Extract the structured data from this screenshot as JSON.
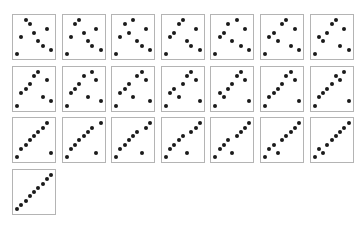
{
  "figure": {
    "columns": 7,
    "panel_width": 44,
    "panel_height": 46,
    "pitch_x": 49.6,
    "pitch_y": 51.7,
    "border_color": "#b4b4b4",
    "dot_color": "#1a1a1a"
  },
  "chart_data": {
    "type": "scatter",
    "title": "",
    "xlabel": "",
    "ylabel": "",
    "n": 9,
    "xlim": [
      0,
      8
    ],
    "ylim": [
      0,
      8
    ],
    "grid": false,
    "steps": [
      [
        0,
        4,
        8,
        7,
        5,
        3,
        2,
        6,
        1
      ],
      [
        0,
        4,
        7,
        8,
        5,
        3,
        2,
        6,
        1
      ],
      [
        0,
        4,
        7,
        5,
        8,
        3,
        2,
        6,
        1
      ],
      [
        0,
        4,
        5,
        7,
        8,
        3,
        2,
        6,
        1
      ],
      [
        0,
        4,
        5,
        7,
        3,
        8,
        2,
        6,
        1
      ],
      [
        0,
        4,
        5,
        3,
        7,
        8,
        2,
        6,
        1
      ],
      [
        0,
        4,
        3,
        5,
        7,
        8,
        2,
        6,
        1
      ],
      [
        0,
        3,
        4,
        5,
        7,
        8,
        2,
        6,
        1
      ],
      [
        0,
        3,
        4,
        5,
        7,
        2,
        8,
        6,
        1
      ],
      [
        0,
        3,
        4,
        5,
        2,
        7,
        8,
        6,
        1
      ],
      [
        0,
        3,
        4,
        2,
        5,
        7,
        8,
        6,
        1
      ],
      [
        0,
        3,
        2,
        4,
        5,
        7,
        8,
        6,
        1
      ],
      [
        0,
        2,
        3,
        4,
        5,
        7,
        8,
        6,
        1
      ],
      [
        0,
        2,
        3,
        4,
        5,
        7,
        6,
        8,
        1
      ],
      [
        0,
        2,
        3,
        4,
        5,
        6,
        7,
        8,
        1
      ],
      [
        0,
        2,
        3,
        4,
        5,
        6,
        7,
        1,
        8
      ],
      [
        0,
        2,
        3,
        4,
        5,
        6,
        1,
        7,
        8
      ],
      [
        0,
        2,
        3,
        4,
        5,
        1,
        6,
        7,
        8
      ],
      [
        0,
        2,
        3,
        4,
        1,
        5,
        6,
        7,
        8
      ],
      [
        0,
        2,
        3,
        1,
        4,
        5,
        6,
        7,
        8
      ],
      [
        0,
        2,
        1,
        3,
        4,
        5,
        6,
        7,
        8
      ],
      [
        0,
        1,
        2,
        3,
        4,
        5,
        6,
        7,
        8
      ]
    ]
  }
}
